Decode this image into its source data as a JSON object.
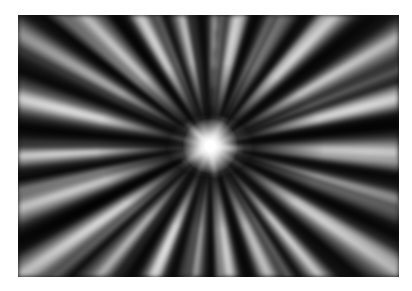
{
  "image": {
    "subject": "radial zoom-burst light rays",
    "style": "black and white",
    "background_color": "#ffffff",
    "burst_center_color": "#ffffff",
    "ray_dark_color": "#000000",
    "ray_light_color": "#e8e8e8"
  }
}
